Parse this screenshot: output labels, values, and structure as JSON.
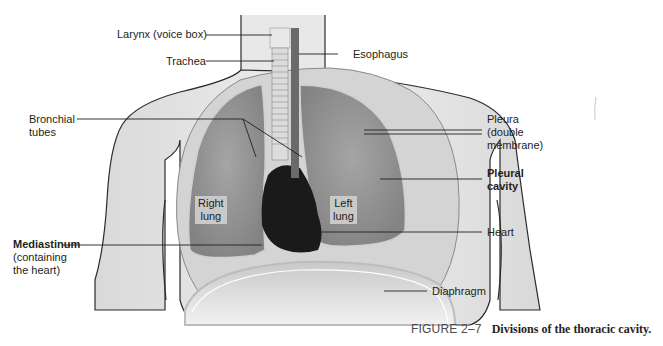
{
  "figure": {
    "number": "FIGURE 2–7",
    "title": "Divisions of the thoracic cavity."
  },
  "labels": {
    "larynx": "Larynx (voice box)",
    "trachea": "Trachea",
    "esophagus": "Esophagus",
    "bronchial_tubes": [
      "Bronchial",
      "tubes"
    ],
    "pleura": [
      "Pleura",
      "(double",
      "membrane)"
    ],
    "pleural_cavity": [
      "Pleural",
      "cavity"
    ],
    "right_lung": [
      "Right",
      "lung"
    ],
    "left_lung": [
      "Left",
      "lung"
    ],
    "mediastinum": "Mediastinum",
    "mediastinum_note": [
      "(containing",
      "the heart)"
    ],
    "heart": "Heart",
    "diaphragm": "Diaphragm"
  },
  "colors": {
    "body_skin": "#e4e4e4",
    "lung": "#9a9a9a",
    "pleura": "#d4d4d4",
    "heart": "#1a1a1a",
    "outline": "#2b2b2b",
    "leader_line": "#231f20"
  }
}
